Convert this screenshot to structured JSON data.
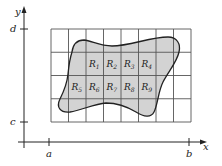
{
  "diagram": {
    "type": "double-integral-region-partition",
    "axes": {
      "x_label": "x",
      "y_label": "y",
      "x_ticks": [
        {
          "label": "a"
        },
        {
          "label": "b"
        }
      ],
      "y_ticks": [
        {
          "label": "c"
        },
        {
          "label": "d"
        }
      ]
    },
    "grid": {
      "columns": 8,
      "rows": 4,
      "line_color": "#555555"
    },
    "region": {
      "fill_color": "#d3d3d3",
      "stroke_color": "#222222"
    },
    "subrectangles": [
      {
        "label": "R",
        "sub": "1",
        "row": 1,
        "col": 2
      },
      {
        "label": "R",
        "sub": "2",
        "row": 1,
        "col": 3
      },
      {
        "label": "R",
        "sub": "3",
        "row": 1,
        "col": 4
      },
      {
        "label": "R",
        "sub": "4",
        "row": 1,
        "col": 5
      },
      {
        "label": "R",
        "sub": "5",
        "row": 2,
        "col": 1
      },
      {
        "label": "R",
        "sub": "6",
        "row": 2,
        "col": 2
      },
      {
        "label": "R",
        "sub": "7",
        "row": 2,
        "col": 3
      },
      {
        "label": "R",
        "sub": "8",
        "row": 2,
        "col": 4
      },
      {
        "label": "R",
        "sub": "9",
        "row": 2,
        "col": 5
      }
    ]
  }
}
